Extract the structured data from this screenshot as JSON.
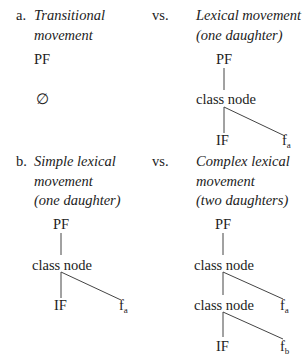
{
  "part_a": {
    "label": "a.",
    "vs": "vs.",
    "left": {
      "title_line1": "Transitional",
      "title_line2": "movement",
      "tree": {
        "root": "PF",
        "child": "∅"
      }
    },
    "right": {
      "title_line1": "Lexical movement",
      "title_line2": "(one daughter)",
      "tree": {
        "root": "PF",
        "class_node": "class node",
        "left_leaf": "IF",
        "right_leaf": "f",
        "right_leaf_sub": "a"
      }
    }
  },
  "part_b": {
    "label": "b.",
    "vs": "vs.",
    "left": {
      "title_line1": "Simple lexical",
      "title_line2": "movement",
      "title_line3": "(one daughter)",
      "tree": {
        "root": "PF",
        "class_node": "class node",
        "left_leaf": "IF",
        "right_leaf": "f",
        "right_leaf_sub": "a"
      }
    },
    "right": {
      "title_line1": "Complex lexical",
      "title_line2": "movement",
      "title_line3": "(two daughters)",
      "tree": {
        "root": "PF",
        "class_node_1": "class node",
        "class_node_2": "class node",
        "leaf_1": "f",
        "leaf_1_sub": "a",
        "bottom_left_leaf": "IF",
        "leaf_2": "f",
        "leaf_2_sub": "b"
      }
    }
  }
}
